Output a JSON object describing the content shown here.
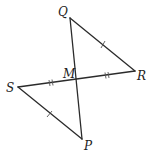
{
  "figure": {
    "points": {
      "Q": {
        "label": "Q"
      },
      "R": {
        "label": "R"
      },
      "S": {
        "label": "S"
      },
      "P": {
        "label": "P"
      },
      "M": {
        "label": "M"
      }
    },
    "segments": [
      {
        "from": "Q",
        "to": "P",
        "name": "QP"
      },
      {
        "from": "S",
        "to": "R",
        "name": "SR"
      },
      {
        "from": "Q",
        "to": "R",
        "name": "QR",
        "tick_marks": 1
      },
      {
        "from": "S",
        "to": "P",
        "name": "SP",
        "tick_marks": 1
      }
    ],
    "congruence_marks": [
      {
        "segment": "QR",
        "ticks": 1
      },
      {
        "segment": "SP",
        "ticks": 1
      },
      {
        "segment": "SM",
        "ticks": 2
      },
      {
        "segment": "MR",
        "ticks": 2
      }
    ],
    "colors": {
      "line": "#2b2b2b",
      "text": "#222222",
      "background": "#ffffff"
    }
  }
}
